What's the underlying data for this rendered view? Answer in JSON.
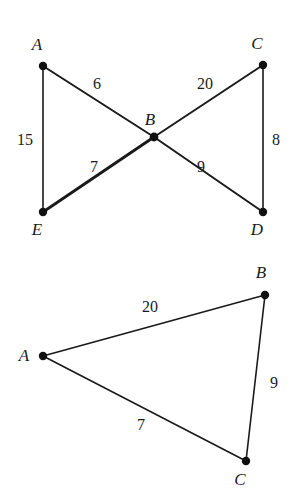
{
  "figure": {
    "background_color": "#ffffff",
    "stroke_color": "#1a1a1a",
    "title": ""
  },
  "diagrams": [
    {
      "name": "bowtie-figure",
      "shape": "two triangles meeting at common vertex B",
      "vertices": [
        {
          "id": "A",
          "label": "A",
          "x": 43,
          "y": 66,
          "label_x": 37,
          "label_y": 50
        },
        {
          "id": "C",
          "label": "C",
          "x": 263,
          "y": 65,
          "label_x": 257,
          "label_y": 49
        },
        {
          "id": "B",
          "label": "B",
          "x": 154,
          "y": 137,
          "label_x": 150,
          "label_y": 125
        },
        {
          "id": "E",
          "label": "E",
          "x": 43,
          "y": 212,
          "label_x": 37,
          "label_y": 235
        },
        {
          "id": "D",
          "label": "D",
          "x": 263,
          "y": 212,
          "label_x": 257,
          "label_y": 235
        }
      ],
      "edges": [
        {
          "from": "A",
          "to": "E",
          "length": "15",
          "label_x": 25,
          "label_y": 145,
          "weight": "thin"
        },
        {
          "from": "A",
          "to": "B",
          "length": "6",
          "label_x": 97,
          "label_y": 89,
          "weight": "med"
        },
        {
          "from": "C",
          "to": "B",
          "length": "20",
          "label_x": 205,
          "label_y": 89,
          "weight": "med"
        },
        {
          "from": "E",
          "to": "B",
          "length": "7",
          "label_x": 94,
          "label_y": 172,
          "weight": "bold"
        },
        {
          "from": "D",
          "to": "B",
          "length": "9",
          "label_x": 201,
          "label_y": 172,
          "weight": "med"
        },
        {
          "from": "C",
          "to": "D",
          "length": "8",
          "label_x": 276,
          "label_y": 145,
          "weight": "thin"
        }
      ]
    },
    {
      "name": "triangle-figure",
      "shape": "triangle ABC",
      "vertices": [
        {
          "id": "A",
          "label": "A",
          "x": 43,
          "y": 356,
          "label_x": 24,
          "label_y": 361
        },
        {
          "id": "B",
          "label": "B",
          "x": 265,
          "y": 295,
          "label_x": 261,
          "label_y": 278
        },
        {
          "id": "C",
          "label": "C",
          "x": 246,
          "y": 461,
          "label_x": 240,
          "label_y": 485
        }
      ],
      "edges": [
        {
          "from": "A",
          "to": "B",
          "length": "20",
          "label_x": 150,
          "label_y": 312,
          "weight": "thin"
        },
        {
          "from": "B",
          "to": "C",
          "length": "9",
          "label_x": 274,
          "label_y": 388,
          "weight": "thin"
        },
        {
          "from": "A",
          "to": "C",
          "length": "7",
          "label_x": 141,
          "label_y": 430,
          "weight": "thin"
        }
      ]
    }
  ]
}
